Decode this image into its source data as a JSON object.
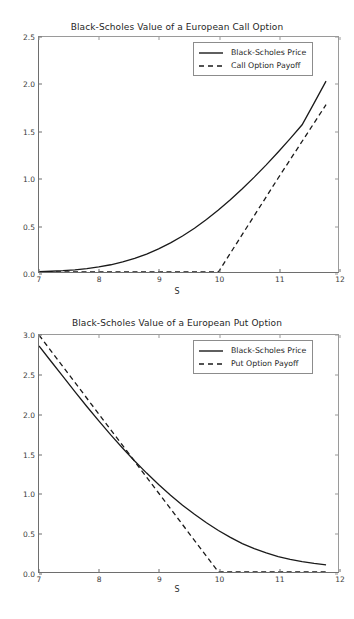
{
  "figure": {
    "background_color": "#ffffff",
    "line_color": "#1a1a1a",
    "axis_color": "#6e6e6e"
  },
  "xlabel": "S",
  "chart_data": [
    {
      "type": "line",
      "title": "Black-Scholes Value of a European Call Option",
      "xlabel": "S",
      "ylabel": "",
      "xlim": [
        7,
        12
      ],
      "ylim": [
        0.0,
        2.5
      ],
      "xticks": [
        "7",
        "8",
        "9",
        "10",
        "11",
        "12"
      ],
      "xtick_values": [
        7,
        8,
        9,
        10,
        11,
        12
      ],
      "yticks": [
        "0.0",
        "0.5",
        "1.0",
        "1.5",
        "2.0",
        "2.5"
      ],
      "ytick_values": [
        0.0,
        0.5,
        1.0,
        1.5,
        2.0,
        2.5
      ],
      "grid": false,
      "legend_position": "upper center",
      "strike": 10,
      "series": [
        {
          "name": "Black-Scholes Price",
          "style": "solid",
          "x": [
            7.0,
            7.2,
            7.4,
            7.6,
            7.8,
            8.0,
            8.2,
            8.4,
            8.6,
            8.8,
            9.0,
            9.2,
            9.4,
            9.6,
            9.8,
            10.0,
            10.2,
            10.4,
            10.6,
            10.8,
            11.0,
            11.2,
            11.4,
            11.6,
            11.8
          ],
          "values": [
            0.004,
            0.008,
            0.014,
            0.023,
            0.036,
            0.054,
            0.077,
            0.107,
            0.145,
            0.191,
            0.246,
            0.31,
            0.383,
            0.466,
            0.558,
            0.659,
            0.768,
            0.885,
            1.009,
            1.14,
            1.277,
            1.419,
            1.566,
            1.796,
            2.03
          ]
        },
        {
          "name": "Call Option Payoff",
          "style": "dashed",
          "x": [
            7.0,
            8.0,
            9.0,
            10.0,
            11.0,
            11.8
          ],
          "values": [
            0.0,
            0.0,
            0.0,
            0.0,
            1.0,
            1.78
          ]
        }
      ]
    },
    {
      "type": "line",
      "title": "Black-Scholes Value of a European Put Option",
      "xlabel": "S",
      "ylabel": "",
      "xlim": [
        7,
        12
      ],
      "ylim": [
        0.0,
        3.0
      ],
      "xticks": [
        "7",
        "8",
        "9",
        "10",
        "11",
        "12"
      ],
      "xtick_values": [
        7,
        8,
        9,
        10,
        11,
        12
      ],
      "yticks": [
        "0.0",
        "0.5",
        "1.0",
        "1.5",
        "2.0",
        "2.5",
        "3.0"
      ],
      "ytick_values": [
        0.0,
        0.5,
        1.0,
        1.5,
        2.0,
        2.5,
        3.0
      ],
      "grid": false,
      "legend_position": "upper center",
      "strike": 10,
      "series": [
        {
          "name": "Black-Scholes Price",
          "style": "solid",
          "x": [
            7.0,
            7.2,
            7.4,
            7.6,
            7.8,
            8.0,
            8.2,
            8.4,
            8.6,
            8.8,
            9.0,
            9.2,
            9.4,
            9.6,
            9.8,
            10.0,
            10.2,
            10.4,
            10.6,
            10.8,
            11.0,
            11.2,
            11.4,
            11.6,
            11.8
          ],
          "values": [
            2.862,
            2.668,
            2.475,
            2.283,
            2.095,
            1.912,
            1.735,
            1.566,
            1.405,
            1.252,
            1.108,
            0.972,
            0.846,
            0.73,
            0.623,
            0.526,
            0.438,
            0.36,
            0.296,
            0.241,
            0.196,
            0.16,
            0.131,
            0.108,
            0.09
          ]
        },
        {
          "name": "Put Option Payoff",
          "style": "dashed",
          "x": [
            7.0,
            8.0,
            9.0,
            10.0,
            11.0,
            11.8
          ],
          "values": [
            3.0,
            2.0,
            1.0,
            0.0,
            0.0,
            0.0
          ]
        }
      ]
    }
  ]
}
